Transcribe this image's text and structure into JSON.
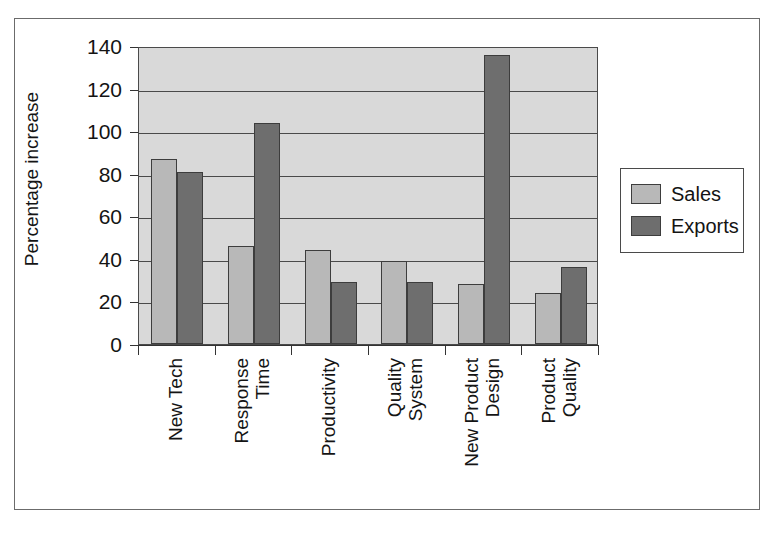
{
  "chart_data": {
    "type": "bar",
    "title": "",
    "xlabel": "",
    "ylabel": "Percentage increase",
    "ylim": [
      0,
      140
    ],
    "ytick_values": [
      0,
      20,
      40,
      60,
      80,
      100,
      120,
      140
    ],
    "ytick_labels": [
      "0",
      "20",
      "40",
      "60",
      "80",
      "100",
      "120",
      "140"
    ],
    "grid": true,
    "legend_position": "right",
    "categories": [
      "New Tech",
      "Response Time",
      "Productivity",
      "Quality System",
      "New Product Design",
      "Product Quality"
    ],
    "category_lines": [
      [
        "New Tech"
      ],
      [
        "Response",
        "Time"
      ],
      [
        "Productivity"
      ],
      [
        "Quality",
        "System"
      ],
      [
        "New Product",
        "Design"
      ],
      [
        "Product",
        "Quality"
      ]
    ],
    "series": [
      {
        "name": "Sales",
        "color": "#b8b8b8",
        "values": [
          87,
          46,
          44,
          39,
          28,
          24
        ]
      },
      {
        "name": "Exports",
        "color": "#6e6e6e",
        "values": [
          81,
          104,
          29,
          29,
          136,
          36
        ]
      }
    ]
  },
  "legend": {
    "entries": [
      {
        "label": "Sales",
        "swatch": "sales"
      },
      {
        "label": "Exports",
        "swatch": "exports"
      }
    ]
  },
  "colors": {
    "sales": "#b8b8b8",
    "exports": "#6e6e6e",
    "plot_background": "#d9d9d9",
    "axis": "#333333",
    "frame": "#6b6b6b"
  }
}
